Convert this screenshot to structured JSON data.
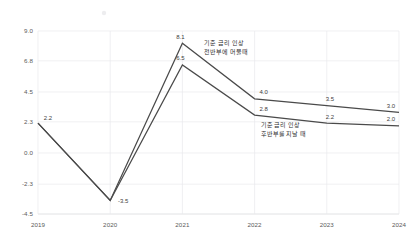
{
  "chart_data": {
    "type": "line",
    "title": "",
    "subtitle": "",
    "xlabel": "",
    "ylabel": "",
    "categories": [
      "2019",
      "2020",
      "2021",
      "2022",
      "2023",
      "2024"
    ],
    "x": [
      2019,
      2020,
      2021,
      2022,
      2023,
      2024
    ],
    "xlim": [
      2019,
      2024
    ],
    "ylim": [
      -4.5,
      9.0
    ],
    "yticks": [
      9.0,
      6.8,
      4.5,
      2.3,
      0.0,
      -2.3,
      -4.5
    ],
    "ytick_labels": [
      "9.0",
      "6.8",
      "4.5",
      "2.3",
      "0.0",
      "-2.3",
      "-4.5"
    ],
    "grid": true,
    "legend": "none",
    "series": [
      {
        "name": "기준 금리 인상 전반부에 머물때",
        "values": [
          2.2,
          -3.5,
          8.1,
          4.0,
          3.5,
          3.0
        ],
        "labels": [
          "2.2",
          "-3.5",
          "8.1",
          "4.0",
          "3.5",
          "3.0"
        ],
        "color": "#4a4a4a"
      },
      {
        "name": "기준 금리 인상 후반부를 지날 때",
        "values": [
          2.2,
          -3.5,
          6.5,
          2.8,
          2.2,
          2.0
        ],
        "labels": [
          "2.2",
          "-3.5",
          "6.5",
          "2.8",
          "2.2",
          "2.0"
        ],
        "color": "#4a4a4a"
      }
    ],
    "annotations": [
      {
        "id": "upper-scenario",
        "lines": [
          "기준 금리 인상",
          "전반부에 머물때"
        ],
        "anchor_x": 2021.25,
        "anchor_y": 8.0
      },
      {
        "id": "lower-scenario",
        "lines": [
          "기준 금리 인상",
          "후반부를 지날 때"
        ],
        "anchor_x": 2022.08,
        "anchor_y": 2.0
      }
    ]
  },
  "axes": {
    "y_tick_labels": [
      "9.0",
      "6.8",
      "4.5",
      "2.3",
      "0.0",
      "-2.3",
      "-4.5"
    ],
    "x_tick_labels": [
      "2019",
      "2020",
      "2021",
      "2022",
      "2023",
      "2024"
    ]
  },
  "point_labels": {
    "upper": [
      "2.2",
      "-3.5",
      "8.1",
      "4.0",
      "3.5",
      "3.0"
    ],
    "lower": [
      "2.2",
      "-3.5",
      "6.5",
      "2.8",
      "2.2",
      "2.0"
    ]
  },
  "annotation_upper": {
    "line1": "기준 금리 인상",
    "line2": "전반부에 머물때"
  },
  "annotation_lower": {
    "line1": "기준 금리 인상",
    "line2": "후반부를 지날 때"
  }
}
